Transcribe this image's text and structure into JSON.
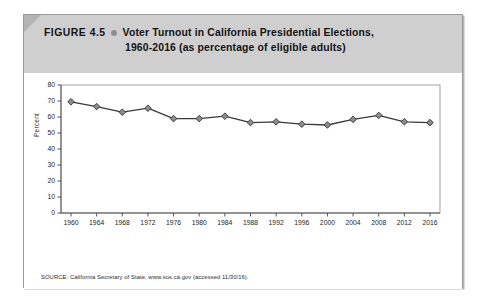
{
  "figure": {
    "number_label": "FIGURE 4.5",
    "bullet_icon": "bullet-dot-icon",
    "title_line_1": "Voter Turnout in California Presidential Elections,",
    "title_line_2": "1960-2016 (as percentage of eligible adults)",
    "source_note": "SOURCE: California Secretary of State, www.sos.ca.gov (accessed 11/30/16)."
  },
  "colors": {
    "header_background": "#cfcfcf",
    "corner_fold": "#b4b4b4",
    "card_border": "#9a9a9a",
    "line": "#3a3a3a",
    "marker_fill": "#8c8c8c",
    "marker_stroke": "#333333",
    "axis": "#555555",
    "plot_background": "#ffffff"
  },
  "chart_data": {
    "type": "line",
    "title": "Voter Turnout in California Presidential Elections, 1960-2016 (as percentage of eligible adults)",
    "xlabel": "",
    "ylabel": "Percent",
    "categories": [
      1960,
      1964,
      1968,
      1972,
      1976,
      1980,
      1984,
      1988,
      1992,
      1996,
      2000,
      2004,
      2008,
      2012,
      2016
    ],
    "x_tick_labels": [
      "1960",
      "1964",
      "1968",
      "1972",
      "1976",
      "1980",
      "1984",
      "1988",
      "1992",
      "1996",
      "2000",
      "2004",
      "2008",
      "2012",
      "2016"
    ],
    "values": [
      69.5,
      66.5,
      63.0,
      65.5,
      59.0,
      59.0,
      60.5,
      56.5,
      57.0,
      55.5,
      55.0,
      58.5,
      61.0,
      57.0,
      56.5
    ],
    "y_tick_labels": [
      "0",
      "10",
      "20",
      "30",
      "40",
      "50",
      "60",
      "70",
      "80"
    ],
    "y_ticks": [
      0,
      10,
      20,
      30,
      40,
      50,
      60,
      70,
      80
    ],
    "ylim": [
      0,
      80
    ],
    "xlim": [
      1960,
      2016
    ],
    "grid": false,
    "legend": null,
    "marker": "diamond",
    "series": [
      {
        "name": "Voter turnout",
        "values": [
          69.5,
          66.5,
          63.0,
          65.5,
          59.0,
          59.0,
          60.5,
          56.5,
          57.0,
          55.5,
          55.0,
          58.5,
          61.0,
          57.0,
          56.5
        ]
      }
    ]
  }
}
